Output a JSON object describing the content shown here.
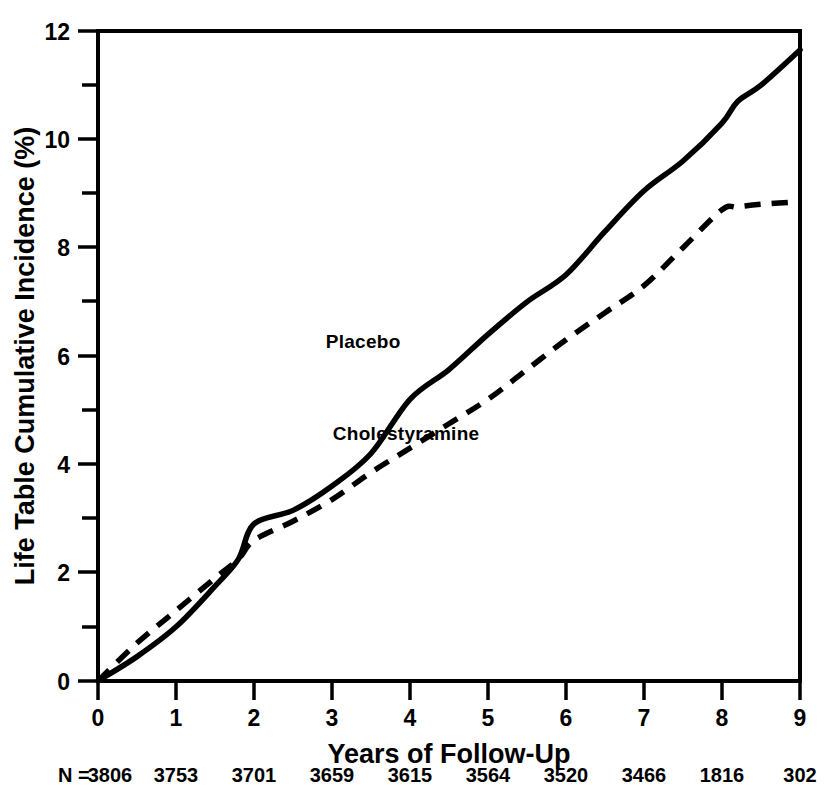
{
  "chart_data": {
    "type": "line",
    "title": "",
    "xlabel": "Years of Follow-Up",
    "ylabel": "Life Table Cumulative Incidence (%)",
    "xlim": [
      0,
      9
    ],
    "ylim": [
      0,
      12
    ],
    "grid": false,
    "legend_position": "inline-annotations",
    "x_ticks": [
      "0",
      "1",
      "2",
      "3",
      "4",
      "5",
      "6",
      "7",
      "8",
      "9"
    ],
    "x_tick_values": [
      0,
      1,
      2,
      3,
      4,
      5,
      6,
      7,
      8,
      9
    ],
    "y_ticks": [
      "0",
      "2",
      "4",
      "6",
      "8",
      "10",
      "12"
    ],
    "y_tick_values": [
      0,
      2,
      4,
      6,
      8,
      10,
      12
    ],
    "y_minor_tick_values": [
      1,
      3,
      5,
      7,
      9,
      11
    ],
    "x": [
      0,
      0.5,
      1,
      1.5,
      1.8,
      2,
      2.5,
      3,
      3.5,
      4,
      4.5,
      5,
      5.5,
      6,
      6.5,
      7,
      7.5,
      8,
      8.2,
      8.5,
      9
    ],
    "series": [
      {
        "name": "Placebo",
        "style": "solid",
        "values": [
          0.0,
          0.45,
          1.0,
          1.75,
          2.25,
          2.9,
          3.15,
          3.6,
          4.2,
          5.2,
          5.75,
          6.4,
          7.0,
          7.5,
          8.3,
          9.05,
          9.6,
          10.3,
          10.7,
          11.0,
          11.65
        ],
        "label_x": 3.4,
        "label_y": 6.15
      },
      {
        "name": "Cholestyramine",
        "style": "dashed",
        "values": [
          0.0,
          0.7,
          1.3,
          1.9,
          2.25,
          2.6,
          2.95,
          3.35,
          3.85,
          4.3,
          4.75,
          5.2,
          5.75,
          6.3,
          6.8,
          7.3,
          8.0,
          8.7,
          8.75,
          8.8,
          8.85
        ],
        "label_x": 3.95,
        "label_y": 4.45
      }
    ],
    "at_risk_row": {
      "prefix": "N =",
      "values": [
        "3806",
        "3753",
        "3701",
        "3659",
        "3615",
        "3564",
        "3520",
        "3466",
        "1816",
        "302"
      ]
    }
  }
}
